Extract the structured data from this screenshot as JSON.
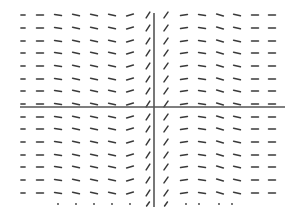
{
  "chart_data": {
    "type": "slope-field",
    "title": "",
    "xlabel": "",
    "ylabel": "",
    "grid": false,
    "legend": null,
    "axes": {
      "x_axis": {
        "y": 107,
        "x_start": 20,
        "x_end": 285
      },
      "y_axis": {
        "x": 154,
        "y_start": 13,
        "y_end": 207
      }
    },
    "columns_x": [
      23,
      40,
      58,
      76,
      94,
      112,
      130,
      148,
      166,
      184,
      202,
      220,
      237,
      255,
      272
    ],
    "column_slope_angles_deg": [
      0,
      0,
      -10,
      -12,
      -12,
      -12,
      15,
      58,
      55,
      10,
      -10,
      -15,
      -12,
      0,
      0
    ],
    "rows_y": [
      15,
      28,
      41,
      53,
      66,
      79,
      91,
      104,
      117,
      129,
      142,
      155,
      167,
      180,
      193
    ],
    "segment_length": 7,
    "bottom_row": {
      "y": 204,
      "marks": [
        {
          "x": 58,
          "kind": "dot"
        },
        {
          "x": 76,
          "kind": "dot"
        },
        {
          "x": 94,
          "kind": "dot"
        },
        {
          "x": 112,
          "kind": "dot"
        },
        {
          "x": 130,
          "kind": "dot"
        },
        {
          "x": 148,
          "kind": "slash"
        },
        {
          "x": 166,
          "kind": "slash"
        },
        {
          "x": 186,
          "kind": "dot"
        },
        {
          "x": 199,
          "kind": "dot"
        },
        {
          "x": 219,
          "kind": "dot"
        },
        {
          "x": 232,
          "kind": "dot"
        }
      ]
    },
    "colors": {
      "segment": "#3a3a3a",
      "axis": "#555555",
      "background": "#ffffff"
    }
  }
}
